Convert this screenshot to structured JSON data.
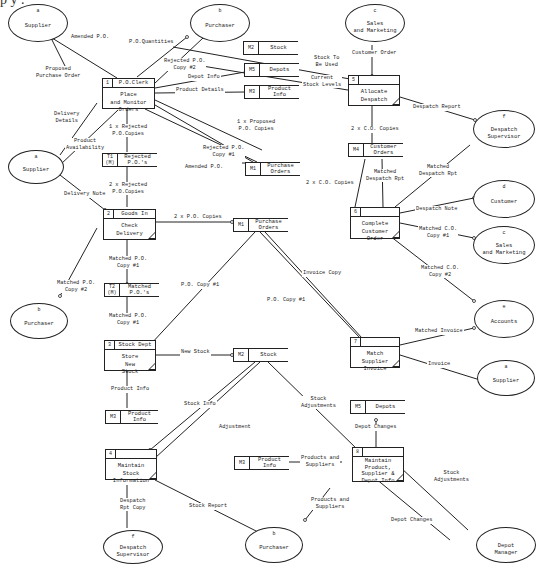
{
  "diagram": {
    "type": "data-flow-diagram",
    "top_cut_text": "p y                                        .",
    "external_entities": [
      {
        "id": "a",
        "label": "Supplier"
      },
      {
        "id": "b",
        "label": "Purchaser"
      },
      {
        "id": "c",
        "label": "Sales\nand Marketing"
      },
      {
        "id": "f",
        "label": "Despatch\nSupervisor"
      },
      {
        "id": "a",
        "label": "Supplier"
      },
      {
        "id": "d",
        "label": "Customer"
      },
      {
        "id": "c",
        "label": "Sales\nand Marketing"
      },
      {
        "id": "b",
        "label": "Purchaser"
      },
      {
        "id": "e",
        "label": "Accounts"
      },
      {
        "id": "a",
        "label": "Supplier"
      },
      {
        "id": "f",
        "label": "Despatch\nSupervisor"
      },
      {
        "id": "b",
        "label": "Purchaser"
      },
      {
        "id": "",
        "label": "Depot\nManager"
      }
    ],
    "processes": [
      {
        "num": "1",
        "location": "P.O.Clerk",
        "name": "Place\nand Monitor\nOrders"
      },
      {
        "num": "5",
        "location": "",
        "name": "Allocate\nDespatch"
      },
      {
        "num": "2",
        "location": "Goods In",
        "name": "Check\nDelivery"
      },
      {
        "num": "6",
        "location": "",
        "name": "Complete\nCustomer\nOrder"
      },
      {
        "num": "3",
        "location": "Stock Dept",
        "name": "Store\nNew\nStock"
      },
      {
        "num": "7",
        "location": "",
        "name": "Match\nSupplier\nInvoice"
      },
      {
        "num": "4",
        "location": "",
        "name": "Maintain\nStock\nInformation"
      },
      {
        "num": "8",
        "location": "",
        "name": "Maintain\nProduct,\nSupplier &\nDepot Info"
      }
    ],
    "data_stores": [
      {
        "id": "M2",
        "label": "Stock"
      },
      {
        "id": "M5",
        "label": "Depots"
      },
      {
        "id": "M3",
        "label": "Product\nInfo"
      },
      {
        "id": "T1\n(M)",
        "label": "Rejected\nP.O.'s"
      },
      {
        "id": "M1",
        "label": "Purchase\nOrders"
      },
      {
        "id": "M4",
        "label": "Customer\nOrders"
      },
      {
        "id": "M1",
        "label": "Purchase\nOrders"
      },
      {
        "id": "T2\n(M)",
        "label": "Matched\nP.O.'s"
      },
      {
        "id": "M2",
        "label": "Stock"
      },
      {
        "id": "M3",
        "label": "Product\nInfo"
      },
      {
        "id": "M5",
        "label": "Depots"
      },
      {
        "id": "M3",
        "label": "Product\nInfo"
      }
    ],
    "flows": [
      {
        "label": "Amended P.O."
      },
      {
        "label": "P.O.Quantities"
      },
      {
        "label": "Proposed\nPurchase Order"
      },
      {
        "label": "Rejected P.O.\nCopy #2"
      },
      {
        "label": "Depot Info"
      },
      {
        "label": "Product Details"
      },
      {
        "label": "Stock To\nBe Used"
      },
      {
        "label": "Current\nStock Levels"
      },
      {
        "label": "Customer Order"
      },
      {
        "label": "Despatch Report"
      },
      {
        "label": "Delivery\nDetails"
      },
      {
        "label": "Product\nAvailability"
      },
      {
        "label": "1 x Rejected\nP.O.Copies"
      },
      {
        "label": "1 x Proposed\nP.O. Copies"
      },
      {
        "label": "Rejected P.O.\nCopy #1"
      },
      {
        "label": "Amended P.O."
      },
      {
        "label": "2 x C.O. Copies"
      },
      {
        "label": "Matched\nDespatch Rpt"
      },
      {
        "label": "Matched\nDespatch Rpt"
      },
      {
        "label": "2 x Rejected\nP.O.Copies"
      },
      {
        "label": "Delivery Note"
      },
      {
        "label": "2 x P.O. Copies"
      },
      {
        "label": "2 x C.O. Copies"
      },
      {
        "label": "Despatch Note"
      },
      {
        "label": "Matched C.O.\nCopy #1"
      },
      {
        "label": "Invoice Copy"
      },
      {
        "label": "Matched C.O.\nCopy #2"
      },
      {
        "label": "Matched P.O.\nCopy #2"
      },
      {
        "label": "Matched P.O.\nCopy #1"
      },
      {
        "label": "P.O. Copy #1"
      },
      {
        "label": "P.O. Copy #1"
      },
      {
        "label": "Matched P.O.\nCopy #1"
      },
      {
        "label": "Matched Invoice"
      },
      {
        "label": "New Stock"
      },
      {
        "label": "Invoice"
      },
      {
        "label": "Product Info"
      },
      {
        "label": "Stock Info"
      },
      {
        "label": "Stock\nAdjustments"
      },
      {
        "label": "Adjustment"
      },
      {
        "label": "Depot Changes"
      },
      {
        "label": "Products and\nSuppliers"
      },
      {
        "label": "Despatch\nRpt Copy"
      },
      {
        "label": "Stock Report"
      },
      {
        "label": "Products and\nSuppliers"
      },
      {
        "label": "Stock\nAdjustments"
      },
      {
        "label": "Depot Changes"
      }
    ]
  }
}
